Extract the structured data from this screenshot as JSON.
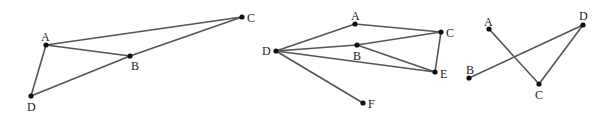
{
  "figures": [
    {
      "id": "figure-1",
      "points": {
        "A": {
          "x": 46,
          "y": 45,
          "lx": 41,
          "ly": 41
        },
        "B": {
          "x": 130,
          "y": 56,
          "lx": 131,
          "ly": 70
        },
        "C": {
          "x": 242,
          "y": 17,
          "lx": 247,
          "ly": 22
        },
        "D": {
          "x": 31,
          "y": 96,
          "lx": 27,
          "ly": 111
        }
      },
      "edges": [
        [
          "A",
          "C"
        ],
        [
          "A",
          "B"
        ],
        [
          "B",
          "C"
        ],
        [
          "A",
          "D"
        ],
        [
          "D",
          "B"
        ]
      ]
    },
    {
      "id": "figure-2",
      "points": {
        "A": {
          "x": 355,
          "y": 24,
          "lx": 351,
          "ly": 20
        },
        "B": {
          "x": 357,
          "y": 45,
          "lx": 353,
          "ly": 60
        },
        "C": {
          "x": 441,
          "y": 32,
          "lx": 446,
          "ly": 37
        },
        "D": {
          "x": 276,
          "y": 51,
          "lx": 262,
          "ly": 55
        },
        "E": {
          "x": 435,
          "y": 72,
          "lx": 440,
          "ly": 78
        },
        "F": {
          "x": 363,
          "y": 103,
          "lx": 368,
          "ly": 108
        }
      },
      "edges": [
        [
          "D",
          "A"
        ],
        [
          "A",
          "C"
        ],
        [
          "D",
          "B"
        ],
        [
          "B",
          "C"
        ],
        [
          "B",
          "E"
        ],
        [
          "D",
          "E"
        ],
        [
          "C",
          "E"
        ],
        [
          "D",
          "F"
        ]
      ]
    },
    {
      "id": "figure-3",
      "points": {
        "A": {
          "x": 489,
          "y": 29,
          "lx": 484,
          "ly": 26
        },
        "B": {
          "x": 469,
          "y": 78,
          "lx": 466,
          "ly": 74
        },
        "C": {
          "x": 539,
          "y": 84,
          "lx": 535,
          "ly": 99
        },
        "D": {
          "x": 583,
          "y": 25,
          "lx": 579,
          "ly": 20
        }
      },
      "edges": [
        [
          "A",
          "C"
        ],
        [
          "C",
          "D"
        ],
        [
          "B",
          "D"
        ]
      ]
    }
  ]
}
